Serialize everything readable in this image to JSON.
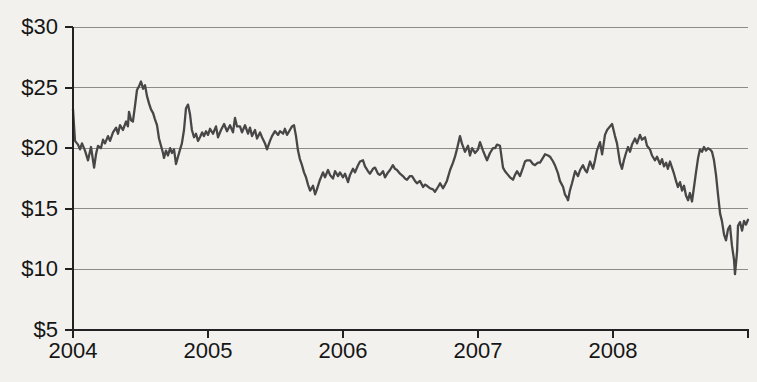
{
  "colors": {
    "background": "#f2f1ed",
    "line": "#474747",
    "grid": "#8d8b86",
    "axis": "#222222",
    "text": "#161616"
  },
  "chart_data": {
    "type": "line",
    "title": "",
    "xlabel": "",
    "ylabel": "",
    "grid": "horizontal",
    "legend": "none",
    "x_axis": {
      "range": [
        2004,
        2009
      ],
      "ticks": [
        2004,
        2005,
        2006,
        2007,
        2008
      ],
      "tick_labels": [
        "2004",
        "2005",
        "2006",
        "2007",
        "2008"
      ],
      "end_tick": 2009
    },
    "y_axis": {
      "range": [
        5,
        30
      ],
      "ticks": [
        5,
        10,
        15,
        20,
        25,
        30
      ],
      "tick_labels": [
        "$5",
        "$10",
        "$15",
        "$20",
        "$25",
        "$30"
      ],
      "unit": "USD"
    },
    "series": [
      {
        "name": "share-price",
        "color": "#474747",
        "points": [
          [
            2004.0,
            23.2
          ],
          [
            2004.015,
            20.6
          ],
          [
            2004.037,
            20.3
          ],
          [
            2004.052,
            19.9
          ],
          [
            2004.067,
            20.4
          ],
          [
            2004.089,
            19.8
          ],
          [
            2004.111,
            19.0
          ],
          [
            2004.133,
            20.1
          ],
          [
            2004.156,
            18.4
          ],
          [
            2004.17,
            19.5
          ],
          [
            2004.185,
            20.2
          ],
          [
            2004.207,
            20.0
          ],
          [
            2004.222,
            20.7
          ],
          [
            2004.237,
            20.4
          ],
          [
            2004.259,
            21.0
          ],
          [
            2004.274,
            20.6
          ],
          [
            2004.296,
            21.3
          ],
          [
            2004.319,
            21.7
          ],
          [
            2004.333,
            21.2
          ],
          [
            2004.348,
            21.9
          ],
          [
            2004.37,
            21.5
          ],
          [
            2004.393,
            22.2
          ],
          [
            2004.407,
            21.8
          ],
          [
            2004.415,
            23.0
          ],
          [
            2004.43,
            22.3
          ],
          [
            2004.444,
            22.2
          ],
          [
            2004.459,
            23.5
          ],
          [
            2004.474,
            24.8
          ],
          [
            2004.489,
            25.1
          ],
          [
            2004.504,
            25.5
          ],
          [
            2004.519,
            24.9
          ],
          [
            2004.533,
            25.2
          ],
          [
            2004.548,
            24.3
          ],
          [
            2004.563,
            23.7
          ],
          [
            2004.578,
            23.2
          ],
          [
            2004.593,
            22.9
          ],
          [
            2004.607,
            22.4
          ],
          [
            2004.622,
            21.9
          ],
          [
            2004.637,
            20.8
          ],
          [
            2004.652,
            20.2
          ],
          [
            2004.667,
            19.6
          ],
          [
            2004.674,
            19.2
          ],
          [
            2004.689,
            19.8
          ],
          [
            2004.704,
            19.4
          ],
          [
            2004.719,
            20.0
          ],
          [
            2004.733,
            19.6
          ],
          [
            2004.748,
            19.9
          ],
          [
            2004.763,
            18.7
          ],
          [
            2004.778,
            19.3
          ],
          [
            2004.793,
            19.9
          ],
          [
            2004.807,
            20.4
          ],
          [
            2004.822,
            21.5
          ],
          [
            2004.837,
            23.3
          ],
          [
            2004.852,
            23.6
          ],
          [
            2004.867,
            22.8
          ],
          [
            2004.881,
            21.5
          ],
          [
            2004.896,
            20.9
          ],
          [
            2004.911,
            21.2
          ],
          [
            2004.926,
            20.6
          ],
          [
            2004.941,
            20.9
          ],
          [
            2004.956,
            21.3
          ],
          [
            2004.97,
            21.0
          ],
          [
            2004.985,
            21.4
          ],
          [
            2005.0,
            21.1
          ],
          [
            2005.015,
            21.6
          ],
          [
            2005.037,
            21.2
          ],
          [
            2005.059,
            21.8
          ],
          [
            2005.074,
            20.9
          ],
          [
            2005.096,
            21.5
          ],
          [
            2005.119,
            22.0
          ],
          [
            2005.141,
            21.4
          ],
          [
            2005.163,
            21.9
          ],
          [
            2005.185,
            21.3
          ],
          [
            2005.2,
            22.5
          ],
          [
            2005.215,
            21.8
          ],
          [
            2005.237,
            21.8
          ],
          [
            2005.252,
            21.3
          ],
          [
            2005.274,
            21.9
          ],
          [
            2005.296,
            21.2
          ],
          [
            2005.311,
            21.7
          ],
          [
            2005.326,
            21.0
          ],
          [
            2005.348,
            21.5
          ],
          [
            2005.363,
            20.8
          ],
          [
            2005.385,
            21.3
          ],
          [
            2005.4,
            20.9
          ],
          [
            2005.422,
            20.4
          ],
          [
            2005.437,
            19.9
          ],
          [
            2005.459,
            20.6
          ],
          [
            2005.474,
            21.0
          ],
          [
            2005.496,
            21.4
          ],
          [
            2005.519,
            21.1
          ],
          [
            2005.533,
            21.4
          ],
          [
            2005.556,
            21.2
          ],
          [
            2005.57,
            21.6
          ],
          [
            2005.585,
            21.1
          ],
          [
            2005.607,
            21.5
          ],
          [
            2005.622,
            21.8
          ],
          [
            2005.637,
            21.9
          ],
          [
            2005.652,
            21.0
          ],
          [
            2005.667,
            19.8
          ],
          [
            2005.681,
            19.1
          ],
          [
            2005.696,
            18.6
          ],
          [
            2005.711,
            18.0
          ],
          [
            2005.726,
            17.6
          ],
          [
            2005.741,
            17.0
          ],
          [
            2005.756,
            16.5
          ],
          [
            2005.778,
            16.9
          ],
          [
            2005.793,
            16.2
          ],
          [
            2005.807,
            16.6
          ],
          [
            2005.83,
            17.4
          ],
          [
            2005.852,
            18.0
          ],
          [
            2005.867,
            17.6
          ],
          [
            2005.889,
            18.2
          ],
          [
            2005.904,
            17.8
          ],
          [
            2005.926,
            17.5
          ],
          [
            2005.941,
            18.1
          ],
          [
            2005.963,
            17.7
          ],
          [
            2005.978,
            18.0
          ],
          [
            2006.0,
            17.6
          ],
          [
            2006.015,
            17.9
          ],
          [
            2006.037,
            17.2
          ],
          [
            2006.052,
            17.8
          ],
          [
            2006.074,
            18.3
          ],
          [
            2006.089,
            18.0
          ],
          [
            2006.111,
            18.6
          ],
          [
            2006.126,
            18.9
          ],
          [
            2006.148,
            19.0
          ],
          [
            2006.163,
            18.5
          ],
          [
            2006.185,
            18.1
          ],
          [
            2006.2,
            17.9
          ],
          [
            2006.222,
            18.3
          ],
          [
            2006.237,
            18.4
          ],
          [
            2006.259,
            17.9
          ],
          [
            2006.274,
            17.8
          ],
          [
            2006.296,
            18.1
          ],
          [
            2006.311,
            17.6
          ],
          [
            2006.333,
            18.0
          ],
          [
            2006.348,
            18.2
          ],
          [
            2006.37,
            18.6
          ],
          [
            2006.385,
            18.3
          ],
          [
            2006.4,
            18.2
          ],
          [
            2006.422,
            17.9
          ],
          [
            2006.444,
            17.7
          ],
          [
            2006.459,
            17.5
          ],
          [
            2006.474,
            17.4
          ],
          [
            2006.496,
            17.7
          ],
          [
            2006.511,
            17.7
          ],
          [
            2006.533,
            17.3
          ],
          [
            2006.548,
            17.1
          ],
          [
            2006.57,
            17.3
          ],
          [
            2006.593,
            16.8
          ],
          [
            2006.607,
            17.0
          ],
          [
            2006.622,
            16.9
          ],
          [
            2006.644,
            16.7
          ],
          [
            2006.667,
            16.6
          ],
          [
            2006.681,
            16.4
          ],
          [
            2006.704,
            16.8
          ],
          [
            2006.719,
            17.1
          ],
          [
            2006.741,
            16.7
          ],
          [
            2006.756,
            17.0
          ],
          [
            2006.77,
            17.3
          ],
          [
            2006.793,
            18.2
          ],
          [
            2006.815,
            18.8
          ],
          [
            2006.83,
            19.3
          ],
          [
            2006.844,
            19.9
          ],
          [
            2006.867,
            21.0
          ],
          [
            2006.881,
            20.4
          ],
          [
            2006.904,
            19.7
          ],
          [
            2006.926,
            20.2
          ],
          [
            2006.941,
            19.4
          ],
          [
            2006.956,
            20.0
          ],
          [
            2006.978,
            19.6
          ],
          [
            2007.0,
            19.9
          ],
          [
            2007.015,
            20.5
          ],
          [
            2007.037,
            19.8
          ],
          [
            2007.052,
            19.4
          ],
          [
            2007.067,
            19.0
          ],
          [
            2007.089,
            19.6
          ],
          [
            2007.111,
            20.0
          ],
          [
            2007.126,
            20.0
          ],
          [
            2007.141,
            20.3
          ],
          [
            2007.163,
            20.2
          ],
          [
            2007.185,
            18.4
          ],
          [
            2007.2,
            18.1
          ],
          [
            2007.222,
            17.8
          ],
          [
            2007.237,
            17.6
          ],
          [
            2007.259,
            17.4
          ],
          [
            2007.274,
            17.8
          ],
          [
            2007.289,
            18.1
          ],
          [
            2007.311,
            17.7
          ],
          [
            2007.333,
            18.4
          ],
          [
            2007.348,
            18.9
          ],
          [
            2007.363,
            19.0
          ],
          [
            2007.385,
            19.0
          ],
          [
            2007.407,
            18.7
          ],
          [
            2007.422,
            18.6
          ],
          [
            2007.444,
            18.8
          ],
          [
            2007.459,
            18.8
          ],
          [
            2007.481,
            19.2
          ],
          [
            2007.496,
            19.5
          ],
          [
            2007.519,
            19.4
          ],
          [
            2007.533,
            19.3
          ],
          [
            2007.556,
            18.9
          ],
          [
            2007.57,
            18.6
          ],
          [
            2007.593,
            17.9
          ],
          [
            2007.607,
            17.3
          ],
          [
            2007.63,
            16.8
          ],
          [
            2007.644,
            16.2
          ],
          [
            2007.659,
            15.9
          ],
          [
            2007.667,
            15.7
          ],
          [
            2007.681,
            16.5
          ],
          [
            2007.696,
            17.1
          ],
          [
            2007.719,
            18.1
          ],
          [
            2007.741,
            17.7
          ],
          [
            2007.756,
            18.2
          ],
          [
            2007.778,
            18.6
          ],
          [
            2007.793,
            18.2
          ],
          [
            2007.807,
            18.0
          ],
          [
            2007.83,
            18.9
          ],
          [
            2007.852,
            18.3
          ],
          [
            2007.867,
            19.0
          ],
          [
            2007.881,
            19.8
          ],
          [
            2007.904,
            20.5
          ],
          [
            2007.919,
            19.5
          ],
          [
            2007.941,
            21.1
          ],
          [
            2007.956,
            21.5
          ],
          [
            2007.978,
            21.8
          ],
          [
            2007.993,
            22.0
          ],
          [
            2008.015,
            21.0
          ],
          [
            2008.03,
            20.4
          ],
          [
            2008.052,
            18.8
          ],
          [
            2008.067,
            18.3
          ],
          [
            2008.081,
            19.0
          ],
          [
            2008.096,
            19.6
          ],
          [
            2008.111,
            20.1
          ],
          [
            2008.126,
            19.7
          ],
          [
            2008.141,
            20.3
          ],
          [
            2008.163,
            20.8
          ],
          [
            2008.178,
            20.4
          ],
          [
            2008.2,
            21.1
          ],
          [
            2008.215,
            20.7
          ],
          [
            2008.237,
            20.9
          ],
          [
            2008.252,
            20.2
          ],
          [
            2008.274,
            19.9
          ],
          [
            2008.289,
            19.4
          ],
          [
            2008.311,
            19.0
          ],
          [
            2008.326,
            19.3
          ],
          [
            2008.348,
            18.7
          ],
          [
            2008.363,
            19.1
          ],
          [
            2008.378,
            18.5
          ],
          [
            2008.393,
            18.8
          ],
          [
            2008.407,
            18.3
          ],
          [
            2008.422,
            18.9
          ],
          [
            2008.437,
            18.4
          ],
          [
            2008.452,
            17.9
          ],
          [
            2008.467,
            17.3
          ],
          [
            2008.481,
            16.8
          ],
          [
            2008.496,
            17.2
          ],
          [
            2008.511,
            16.5
          ],
          [
            2008.526,
            16.9
          ],
          [
            2008.541,
            16.1
          ],
          [
            2008.556,
            15.7
          ],
          [
            2008.57,
            16.3
          ],
          [
            2008.585,
            15.6
          ],
          [
            2008.6,
            16.8
          ],
          [
            2008.615,
            18.0
          ],
          [
            2008.63,
            19.2
          ],
          [
            2008.644,
            19.9
          ],
          [
            2008.659,
            19.7
          ],
          [
            2008.674,
            20.1
          ],
          [
            2008.689,
            19.8
          ],
          [
            2008.704,
            20.0
          ],
          [
            2008.719,
            19.9
          ],
          [
            2008.733,
            19.7
          ],
          [
            2008.748,
            19.0
          ],
          [
            2008.763,
            17.8
          ],
          [
            2008.778,
            16.2
          ],
          [
            2008.793,
            14.6
          ],
          [
            2008.807,
            14.0
          ],
          [
            2008.822,
            12.9
          ],
          [
            2008.837,
            12.4
          ],
          [
            2008.852,
            13.3
          ],
          [
            2008.867,
            13.6
          ],
          [
            2008.881,
            12.0
          ],
          [
            2008.896,
            10.8
          ],
          [
            2008.904,
            9.6
          ],
          [
            2008.919,
            11.5
          ],
          [
            2008.926,
            13.6
          ],
          [
            2008.941,
            13.9
          ],
          [
            2008.956,
            13.2
          ],
          [
            2008.97,
            14.0
          ],
          [
            2008.985,
            13.7
          ],
          [
            2009.0,
            14.1
          ]
        ]
      }
    ]
  }
}
